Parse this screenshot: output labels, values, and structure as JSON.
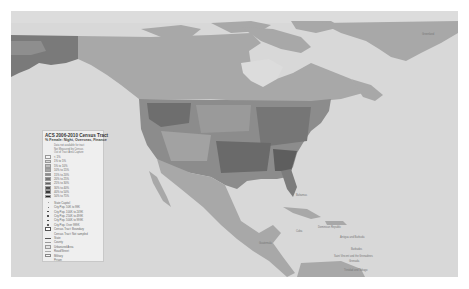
{
  "map": {
    "colors": {
      "ocean": "#d8d8d8",
      "land": "#a9a9a9",
      "land_other": "#b4b4b4",
      "ice_water": "#e0e0e0",
      "alaska": "#7d7d7d",
      "tract_dark": "#555555",
      "tract_mid": "#8c8c8c",
      "tract_light": "#c6c6c6"
    },
    "labels": [
      {
        "text": "Greenland",
        "x": 424,
        "y": 33
      },
      {
        "text": "Bahamas",
        "x": 292,
        "y": 196
      },
      {
        "text": "Cuba",
        "x": 297,
        "y": 231
      },
      {
        "text": "Haiti",
        "x": 318,
        "y": 228
      },
      {
        "text": "Dominican Republic",
        "x": 320,
        "y": 225
      },
      {
        "text": "Antigua and Barbuda",
        "x": 340,
        "y": 236
      },
      {
        "text": "Barbados",
        "x": 350,
        "y": 248
      },
      {
        "text": "Saint Vincent and the Grenadines",
        "x": 335,
        "y": 256
      },
      {
        "text": "Grenada",
        "x": 350,
        "y": 261
      },
      {
        "text": "Trinidad and Tobago",
        "x": 344,
        "y": 270
      },
      {
        "text": "Guatemala",
        "x": 258,
        "y": 243
      },
      {
        "text": "Honduras",
        "x": 265,
        "y": 248
      }
    ]
  },
  "legend": {
    "title": "ACS 2006-2010 Census Tract",
    "subtitle": "% Female: Night, Overseas, Finance",
    "notes": [
      "Data not available for tract",
      "Not Measured by Census",
      "Out of Tract Area Capture"
    ],
    "classes": [
      {
        "label": "< 1%",
        "color": "#f4f4f4"
      },
      {
        "label": "1% to 5%",
        "color": "#d6d6d6"
      },
      {
        "label": "5% to 10%",
        "color": "#bdbdbd"
      },
      {
        "label": "10% to 15%",
        "color": "#a5a5a5"
      },
      {
        "label": "15% to 20%",
        "color": "#8d8d8d"
      },
      {
        "label": "20% to 25%",
        "color": "#767676"
      },
      {
        "label": "25% to 30%",
        "color": "#626262"
      },
      {
        "label": "30% to 40%",
        "color": "#4e4e4e"
      },
      {
        "label": "40% to 50%",
        "color": "#3a3a3a"
      },
      {
        "label": "50% to 75%",
        "color": "#262626"
      }
    ],
    "cities_header": "State Capitol",
    "cities": [
      {
        "label": "City Pop. 50K to 99K",
        "size": 0.8
      },
      {
        "label": "City Pop. 100K to 249K",
        "size": 1.1
      },
      {
        "label": "City Pop. 250K to 499K",
        "size": 1.4
      },
      {
        "label": "City Pop. 500K to 999K",
        "size": 1.7
      },
      {
        "label": "City Pop. Over 999K",
        "size": 2.0
      }
    ],
    "other": [
      {
        "label": "Census Tract: Boundary",
        "type": "box"
      },
      {
        "label": "Census Tract: Not sampled",
        "type": "none"
      },
      {
        "label": "State",
        "type": "line"
      },
      {
        "label": "County",
        "type": "thin"
      },
      {
        "label": "Urbanized Area",
        "type": "thin"
      },
      {
        "label": "Road/Street",
        "type": "thin"
      },
      {
        "label": "Military",
        "type": "box"
      },
      {
        "label": "Prison",
        "type": "none"
      }
    ]
  }
}
